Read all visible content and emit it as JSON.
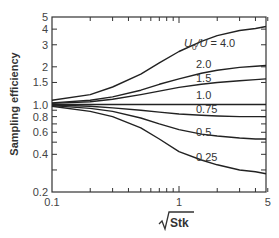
{
  "chart_data": {
    "type": "line",
    "title": "",
    "xlabel": "√Stk",
    "ylabel": "Sampling efficiency",
    "xscale": "log",
    "yscale": "log",
    "xlim": [
      0.1,
      6
    ],
    "ylim": [
      0.2,
      5
    ],
    "x_ticks": [
      "0.1",
      "1",
      "5"
    ],
    "y_ticks": [
      "0.2",
      "0.4",
      "0.6",
      "0.8",
      "1.0",
      "1.5",
      "2",
      "3",
      "4",
      "5"
    ],
    "grid": false,
    "legend": "inline labels",
    "x": [
      0.1,
      0.2,
      0.3,
      0.5,
      0.7,
      1.0,
      1.5,
      2.0,
      3.0,
      4.0,
      6.0
    ],
    "series": [
      {
        "name": "U0/U = 4.0",
        "label": "U₀/U = 4.0",
        "values": [
          1.08,
          1.2,
          1.38,
          1.75,
          2.15,
          2.65,
          3.2,
          3.55,
          3.9,
          4.05,
          4.2
        ]
      },
      {
        "name": "2.0",
        "label": "2.0",
        "values": [
          1.03,
          1.08,
          1.15,
          1.3,
          1.45,
          1.6,
          1.78,
          1.88,
          1.98,
          2.02,
          2.05
        ]
      },
      {
        "name": "1.5",
        "label": "1.5",
        "values": [
          1.02,
          1.05,
          1.1,
          1.2,
          1.28,
          1.37,
          1.45,
          1.5,
          1.55,
          1.58,
          1.6
        ]
      },
      {
        "name": "1.0",
        "label": "1.0",
        "values": [
          1.0,
          1.0,
          1.0,
          1.0,
          1.0,
          1.0,
          1.0,
          1.0,
          1.0,
          1.0,
          1.0
        ]
      },
      {
        "name": "0.75",
        "label": "0.75",
        "values": [
          0.99,
          0.97,
          0.94,
          0.9,
          0.87,
          0.84,
          0.82,
          0.81,
          0.8,
          0.8,
          0.8
        ]
      },
      {
        "name": "0.5",
        "label": "0.5",
        "values": [
          0.98,
          0.93,
          0.88,
          0.78,
          0.7,
          0.63,
          0.58,
          0.56,
          0.54,
          0.53,
          0.53
        ]
      },
      {
        "name": "0.25",
        "label": "0.25",
        "values": [
          0.97,
          0.88,
          0.8,
          0.65,
          0.53,
          0.42,
          0.36,
          0.33,
          0.3,
          0.29,
          0.28
        ]
      }
    ]
  }
}
